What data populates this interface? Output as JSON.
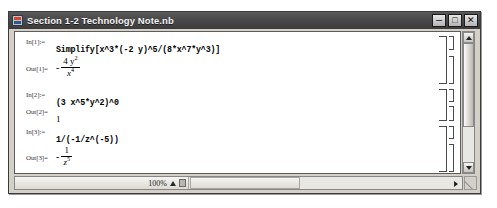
{
  "window": {
    "title": "Section 1-2 Technology Note.nb",
    "icon": "mathematica-notebook-icon",
    "controls": {
      "minimize": "–",
      "maximize": "□",
      "close": "✕"
    }
  },
  "notebook": {
    "cells": [
      {
        "label": "In[1]:=",
        "kind": "input",
        "expression": "Simplify[x^3*(-2 y)^5/(8*x^7*y^3)]"
      },
      {
        "label": "Out[1]=",
        "kind": "output",
        "sign": "-",
        "numerator": "4 y",
        "numerator_exponent": "2",
        "denominator": "x",
        "denominator_exponent": "4"
      },
      {
        "label": "In[2]:=",
        "kind": "input",
        "expression": "(3 x^5*y^2)^0"
      },
      {
        "label": "Out[2]=",
        "kind": "output",
        "value": "1"
      },
      {
        "label": "In[3]:=",
        "kind": "input",
        "expression": "1/(-1/z^(-5))"
      },
      {
        "label": "Out[3]=",
        "kind": "output",
        "sign": "-",
        "numerator": "1",
        "numerator_exponent": "",
        "denominator": "z",
        "denominator_exponent": "5"
      }
    ]
  },
  "statusbar": {
    "zoom_level": "100%",
    "zoom_stepper_icon": "triangle-up-icon",
    "zoom_menu_icon": "dropdown-box-icon"
  },
  "scrollbars": {
    "vertical_up_icon": "triangle-up-icon",
    "vertical_down_icon": "triangle-down-icon",
    "horizontal_right_icon": "triangle-right-icon"
  }
}
